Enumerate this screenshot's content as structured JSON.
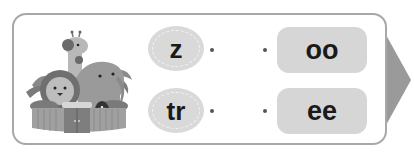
{
  "exercise": {
    "type": "match-the-sounds",
    "illustration": "zoo-animals-illustration",
    "left_items": [
      {
        "label": "z"
      },
      {
        "label": "tr"
      }
    ],
    "right_items": [
      {
        "label": "oo"
      },
      {
        "label": "ee"
      }
    ],
    "next_arrow": "arrow-right-icon"
  },
  "colors": {
    "frame_border": "#a8a8a8",
    "circle_fill": "#d9d9d9",
    "box_fill": "#d6d6d6",
    "arrow_fill": "#9a9a9a",
    "text": "#1a1a1a"
  }
}
